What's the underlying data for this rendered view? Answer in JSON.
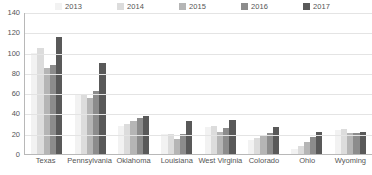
{
  "chart_data": {
    "type": "bar",
    "title": "",
    "subtitle": "",
    "xlabel": "",
    "ylabel": "",
    "ylim": [
      0,
      140
    ],
    "ytick_step": 20,
    "yticks": [
      140,
      120,
      100,
      80,
      60,
      40,
      20,
      0
    ],
    "grid": true,
    "legend_position": "top",
    "categories": [
      "Texas",
      "Pennsylvania",
      "Oklahoma",
      "Louisiana",
      "West Virginia",
      "Colorado",
      "Ohio",
      "Wyoming"
    ],
    "series": [
      {
        "name": "2013",
        "color": "#f2f2f2",
        "values": [
          100,
          58,
          28,
          20,
          27,
          14,
          5,
          24
        ]
      },
      {
        "name": "2014",
        "color": "#dcdcdc",
        "values": [
          105,
          58,
          30,
          20,
          28,
          16,
          8,
          25
        ]
      },
      {
        "name": "2015",
        "color": "#b5b5b5",
        "values": [
          85,
          55,
          33,
          15,
          22,
          18,
          12,
          21
        ]
      },
      {
        "name": "2016",
        "color": "#8c8c8c",
        "values": [
          88,
          62,
          36,
          20,
          26,
          21,
          17,
          21
        ]
      },
      {
        "name": "2017",
        "color": "#595959",
        "values": [
          115,
          90,
          37,
          33,
          34,
          27,
          22,
          22
        ]
      }
    ]
  }
}
